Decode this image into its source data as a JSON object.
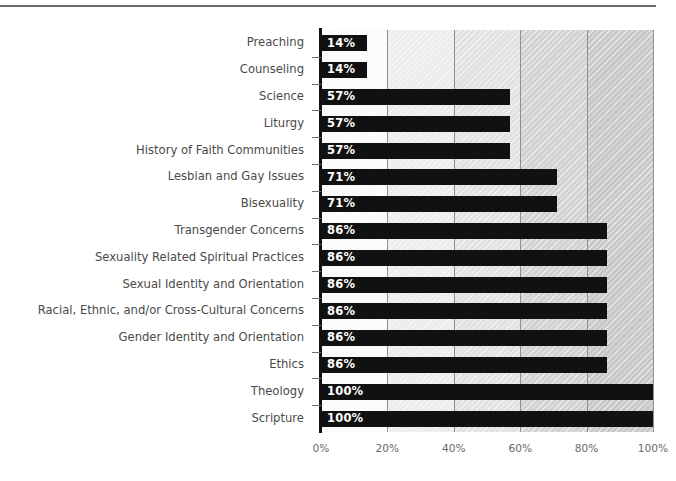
{
  "chart_data": {
    "type": "bar",
    "orientation": "horizontal",
    "title": "",
    "subtitle": "",
    "xlabel": "",
    "ylabel": "",
    "xlim": [
      0,
      100
    ],
    "grid": true,
    "legend": null,
    "value_label_suffix": "%",
    "categories": [
      "Preaching",
      "Counseling",
      "Science",
      "Liturgy",
      "History of Faith Communities",
      "Lesbian and Gay Issues",
      "Bisexuality",
      "Transgender Concerns",
      "Sexuality Related Spiritual Practices",
      "Sexual Identity and Orientation",
      "Racial, Ethnic, and/or Cross-Cultural Concerns",
      "Gender Identity and Orientation",
      "Ethics",
      "Theology",
      "Scripture"
    ],
    "values": [
      14,
      14,
      57,
      57,
      57,
      71,
      71,
      86,
      86,
      86,
      86,
      86,
      86,
      100,
      100
    ],
    "value_labels": [
      "14%",
      "14%",
      "57%",
      "57%",
      "57%",
      "71%",
      "71%",
      "86%",
      "86%",
      "86%",
      "86%",
      "86%",
      "86%",
      "100%",
      "100%"
    ],
    "xticks": [
      0,
      20,
      40,
      60,
      80,
      100
    ],
    "xtick_labels": [
      "0%",
      "20%",
      "40%",
      "60%",
      "80%",
      "100%"
    ],
    "bar_color": "#111111",
    "value_label_color": "#ffffff",
    "category_label_color": "#4a4a4a",
    "tick_label_color": "#6a6a6a",
    "gridline_color": "#8f8f8f",
    "axis_color": "#111111",
    "background_bands": [
      {
        "from": 0,
        "to": 20,
        "color": "#fafafa"
      },
      {
        "from": 20,
        "to": 40,
        "color": "#ececec"
      },
      {
        "from": 40,
        "to": 60,
        "color": "#e2e2e2"
      },
      {
        "from": 60,
        "to": 80,
        "color": "#d2d2d2"
      },
      {
        "from": 80,
        "to": 100,
        "color": "#c8c8c8"
      }
    ]
  },
  "decorations": {
    "top_rule_color": "#6b6b6b"
  }
}
